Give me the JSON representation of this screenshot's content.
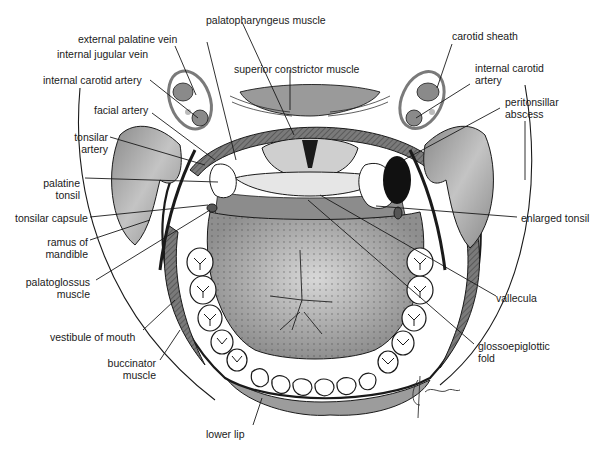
{
  "figure": {
    "colors": {
      "background": "#ffffff",
      "tissue_gray": "#9a9a9a",
      "tongue_gray": "#a8a8a8",
      "tongue_highlight": "#d6d6d6",
      "abscess_black": "#111111",
      "line": "#1a1a1a",
      "tooth_white": "#ffffff",
      "sheath_gray": "#8c8c8c"
    },
    "signature": "Grunther"
  },
  "labels": {
    "left": {
      "external_palatine_vein": "external palatine vein",
      "internal_jugular_vein": "internal jugular vein",
      "internal_carotid_artery": "internal carotid artery",
      "facial_artery": "facial artery",
      "tonsilar_artery_line1": "tonsilar",
      "tonsilar_artery_line2": "artery",
      "palatine_tonsil_line1": "palatine",
      "palatine_tonsil_line2": "tonsil",
      "tonsilar_capsule": "tonsilar capsule",
      "ramus_line1": "ramus of",
      "ramus_line2": "mandible",
      "palatoglossus_line1": "palatoglossus",
      "palatoglossus_line2": "muscle",
      "vestibule_of_mouth": "vestibule of mouth",
      "buccinator_line1": "buccinator",
      "buccinator_line2": "muscle"
    },
    "top": {
      "palatopharyngeus_muscle": "palatopharyngeus muscle",
      "superior_constrictor_muscle": "superior constrictor muscle"
    },
    "right": {
      "carotid_sheath": "carotid sheath",
      "internal_carotid_line1": "internal carotid",
      "internal_carotid_line2": "artery",
      "peritonsillar_line1": "peritonsillar",
      "peritonsillar_line2": "abscess",
      "enlarged_tonsil": "enlarged tonsil",
      "vallecula": "vallecula",
      "glossoepiglottic_line1": "glossoepiglottic",
      "glossoepiglottic_line2": "fold"
    },
    "bottom": {
      "lower_lip": "lower lip"
    }
  }
}
